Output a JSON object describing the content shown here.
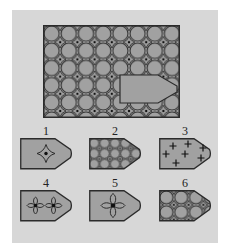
{
  "puzzle": {
    "board": {
      "pattern": "circle-and-four-pointed-star lattice",
      "cutout": "blank pentagon piece pointing right, lower-right area"
    },
    "options": [
      {
        "label": "1",
        "content": "single four-pointed sparkle star in center"
      },
      {
        "label": "2",
        "content": "fine circle-and-star lattice matching the board"
      },
      {
        "label": "3",
        "content": "seven scattered plus signs"
      },
      {
        "label": "4",
        "content": "two four-petal quatrefoil flowers"
      },
      {
        "label": "5",
        "content": "one large four-petal quatrefoil flower"
      },
      {
        "label": "6",
        "content": "coarse circle-and-star lattice"
      }
    ],
    "colors": {
      "background": "#ffffff",
      "panel": "#d7d7d7",
      "shape_fill": "#a1a1a1",
      "outline": "#2b2b2b",
      "label_ink": "#222222"
    }
  }
}
